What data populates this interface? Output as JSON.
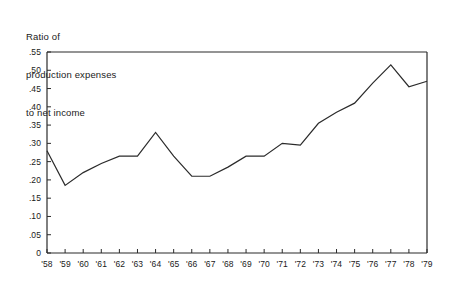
{
  "chart_data": {
    "type": "line",
    "title": "",
    "ylabel_lines": [
      "Ratio of",
      "production expenses",
      "to net income"
    ],
    "xlabel": "",
    "ylabel": "Ratio of production expenses to net income",
    "grid": false,
    "legend": "none",
    "ylim": [
      0,
      0.55
    ],
    "ytick_labels": [
      ".55",
      ".50",
      ".45",
      ".40",
      ".35",
      ".30",
      ".25",
      ".20",
      ".15",
      ".10",
      ".05",
      "0"
    ],
    "ytick_values": [
      0.55,
      0.5,
      0.45,
      0.4,
      0.35,
      0.3,
      0.25,
      0.2,
      0.15,
      0.1,
      0.05,
      0
    ],
    "categories": [
      "'58",
      "'59",
      "'60",
      "'61",
      "'62",
      "'63",
      "'64",
      "'65",
      "'66",
      "'67",
      "'68",
      "'69",
      "'70",
      "'71",
      "'72",
      "'73",
      "'74",
      "'75",
      "'76",
      "'77",
      "'78",
      "'79"
    ],
    "values": [
      0.28,
      0.185,
      0.22,
      0.245,
      0.265,
      0.265,
      0.33,
      0.265,
      0.21,
      0.21,
      0.235,
      0.265,
      0.265,
      0.3,
      0.295,
      0.355,
      0.385,
      0.41,
      0.465,
      0.515,
      0.455,
      0.47
    ],
    "series": [
      {
        "name": "Ratio of production expenses to net income",
        "values": [
          0.28,
          0.185,
          0.22,
          0.245,
          0.265,
          0.265,
          0.33,
          0.265,
          0.21,
          0.21,
          0.235,
          0.265,
          0.265,
          0.3,
          0.295,
          0.355,
          0.385,
          0.41,
          0.465,
          0.515,
          0.455,
          0.47
        ]
      }
    ],
    "line_color": "#2b2b2b",
    "axis_color": "#2b2b2b",
    "background_color": "#ffffff"
  }
}
